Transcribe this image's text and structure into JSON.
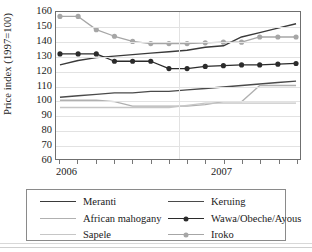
{
  "chart_data": {
    "type": "line",
    "title": "",
    "xlabel": "",
    "ylabel": "Price index (1997=100)",
    "ylim": [
      60,
      160
    ],
    "ytick_step": 10,
    "yticks": [
      160,
      150,
      140,
      130,
      120,
      110,
      100,
      90,
      80,
      70,
      60
    ],
    "grid": true,
    "legend_position": "bottom",
    "x_axis_labels": [
      "2006",
      "2007"
    ],
    "x": [
      0,
      1,
      2,
      3,
      4,
      5,
      6,
      7,
      8,
      9,
      10,
      11,
      12,
      13
    ],
    "series": [
      {
        "name": "Meranti",
        "color": "#3a3a3a",
        "marker": "none",
        "values": [
          124,
          127,
          129,
          130,
          131,
          132,
          133,
          134,
          136,
          137,
          143,
          146,
          149,
          152
        ]
      },
      {
        "name": "Keruing",
        "color": "#4a4a4a",
        "marker": "none",
        "values": [
          102,
          103,
          104,
          105,
          105,
          106,
          106,
          107,
          108,
          109,
          110,
          111,
          112,
          113
        ]
      },
      {
        "name": "African mahogany",
        "color": "#b0b0b0",
        "marker": "none",
        "values": [
          100,
          100,
          100,
          99,
          96,
          96,
          96,
          96,
          97,
          99,
          99,
          110,
          110,
          110
        ]
      },
      {
        "name": "Wawa/Obeche/Ayous",
        "color": "#2b2b2b",
        "marker": "circle",
        "values": [
          131.5,
          131.5,
          131.5,
          126.5,
          126.5,
          126.5,
          121.5,
          121.5,
          123,
          123.5,
          124,
          124,
          124.5,
          125
        ]
      },
      {
        "name": "Sapele",
        "color": "#c6c6c6",
        "marker": "none",
        "values": [
          95,
          95,
          95,
          95,
          95,
          95,
          95,
          96.5,
          98,
          98,
          98,
          98,
          98,
          98
        ]
      },
      {
        "name": "Iroko",
        "color": "#a6a6a6",
        "marker": "circle",
        "values": [
          157,
          157,
          148,
          143.5,
          140,
          138.5,
          138.5,
          138.5,
          139,
          139.5,
          139.5,
          143,
          143,
          143
        ]
      }
    ]
  },
  "legend": {
    "items": [
      {
        "label": "Meranti",
        "color": "#3a3a3a",
        "marker": "none"
      },
      {
        "label": "Keruing",
        "color": "#4a4a4a",
        "marker": "none"
      },
      {
        "label": "African mahogany",
        "color": "#b0b0b0",
        "marker": "none"
      },
      {
        "label": "Wawa/Obeche/Ayous",
        "color": "#2b2b2b",
        "marker": "circle"
      },
      {
        "label": "Sapele",
        "color": "#c6c6c6",
        "marker": "none"
      },
      {
        "label": "Iroko",
        "color": "#a6a6a6",
        "marker": "circle"
      }
    ]
  }
}
